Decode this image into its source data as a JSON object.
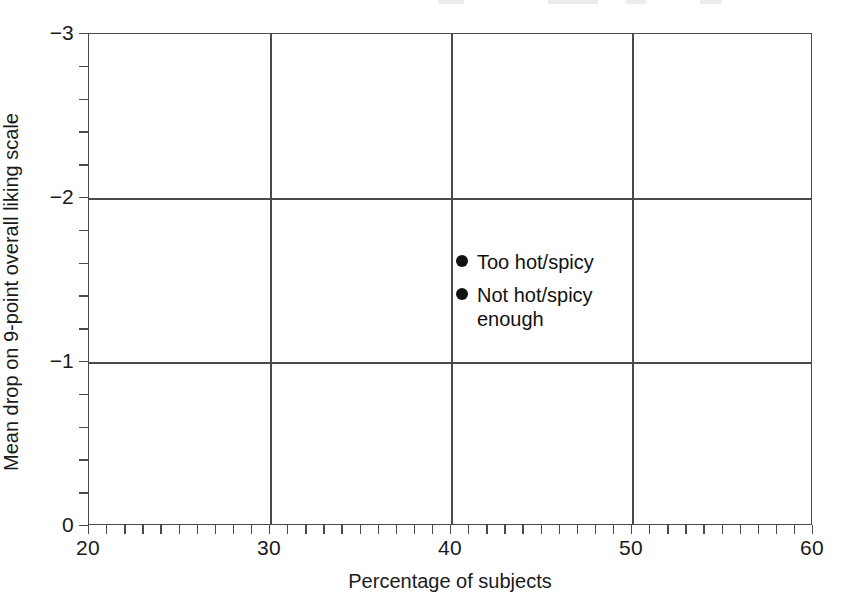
{
  "chart_data": {
    "type": "scatter",
    "title": "",
    "subtitle": "",
    "xlabel": "Percentage of subjects",
    "ylabel": "Mean drop on 9-point overall liking scale",
    "xlim": [
      20,
      60
    ],
    "ylim": [
      0,
      -3
    ],
    "y_axis_inverted": true,
    "grid": true,
    "x_major_ticks": [
      20,
      30,
      40,
      50,
      60
    ],
    "x_tick_labels": [
      "20",
      "30",
      "40",
      "50",
      "60"
    ],
    "x_minor_tick_interval": 1,
    "y_major_ticks": [
      -3,
      -2,
      -1,
      0
    ],
    "y_tick_labels": [
      "−3",
      "−2",
      "−1",
      "0"
    ],
    "y_minor_tick_interval": 0.2,
    "gridlines_x": [
      30,
      40,
      50
    ],
    "gridlines_y": [
      -2,
      -1
    ],
    "legend_position": "inside-center",
    "legend": [
      {
        "name": "Too hot/spicy",
        "marker": "filled-circle",
        "color": "#111111"
      },
      {
        "name": "Not hot/spicy enough",
        "marker": "filled-circle",
        "color": "#111111"
      }
    ],
    "series": [
      {
        "name": "Too hot/spicy",
        "color": "#111111",
        "marker": "filled-circle",
        "x": [],
        "y": []
      },
      {
        "name": "Not hot/spicy enough",
        "color": "#111111",
        "marker": "filled-circle",
        "x": [],
        "y": []
      }
    ],
    "annotations": [],
    "note": "Plot region contains no plotted data points; only the legend key is shown inside the axes."
  },
  "axes": {
    "x_title": "Percentage of subjects",
    "y_title": "Mean drop on 9-point overall liking scale",
    "x_ticks": [
      {
        "value": 20,
        "label": "20"
      },
      {
        "value": 30,
        "label": "30"
      },
      {
        "value": 40,
        "label": "40"
      },
      {
        "value": 50,
        "label": "50"
      },
      {
        "value": 60,
        "label": "60"
      }
    ],
    "y_ticks": [
      {
        "value": -3,
        "label": "−3"
      },
      {
        "value": -2,
        "label": "−2"
      },
      {
        "value": -1,
        "label": "−1"
      },
      {
        "value": 0,
        "label": "0"
      }
    ]
  },
  "legend": {
    "entries": [
      {
        "label_line1": "Too hot/spicy",
        "label_line2": ""
      },
      {
        "label_line1": "Not hot/spicy",
        "label_line2": "enough"
      }
    ]
  },
  "colors": {
    "axis": "#4a4a4a",
    "text": "#1a1a1a",
    "marker": "#111111",
    "background": "#ffffff"
  }
}
